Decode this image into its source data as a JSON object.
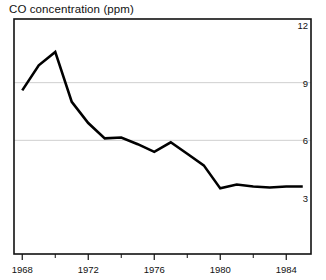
{
  "chart_data": {
    "type": "line",
    "title": "CO concentration (ppm)",
    "xlabel": "",
    "ylabel": "CO concentration (ppm)",
    "x": [
      1968,
      1969,
      1970,
      1971,
      1972,
      1973,
      1974,
      1975,
      1976,
      1977,
      1978,
      1979,
      1980,
      1981,
      1982,
      1983,
      1984,
      1985
    ],
    "values": [
      8.6,
      9.9,
      10.6,
      8.0,
      6.9,
      6.1,
      6.15,
      5.8,
      5.4,
      5.9,
      5.3,
      4.7,
      3.5,
      3.7,
      3.6,
      3.55,
      3.6,
      3.6
    ],
    "series": [
      {
        "name": "CO concentration",
        "values": [
          8.6,
          9.9,
          10.6,
          8.0,
          6.9,
          6.1,
          6.15,
          5.8,
          5.4,
          5.9,
          5.3,
          4.7,
          3.5,
          3.7,
          3.6,
          3.55,
          3.6,
          3.6
        ],
        "color": "#000000"
      }
    ],
    "ylim": [
      0,
      12
    ],
    "xlim": [
      1967.5,
      1985.5
    ],
    "ytick_labels": [
      "12",
      "9",
      "6",
      "3"
    ],
    "ytick_values": [
      12,
      9,
      6,
      3
    ],
    "xtick_labels": [
      "1968",
      "1972",
      "1976",
      "1980",
      "1984"
    ],
    "xtick_values": [
      1968,
      1972,
      1976,
      1980,
      1984
    ],
    "xminor_ticks": [
      1970,
      1974,
      1978,
      1982
    ],
    "grid": "horizontal at 9 and 6",
    "gridlines_at": [
      9,
      6
    ],
    "legend": "none",
    "yaxis_position": "right",
    "line_color": "#000000",
    "grid_color": "#cccccc",
    "frame_color": "#000000",
    "background": "#ffffff"
  }
}
